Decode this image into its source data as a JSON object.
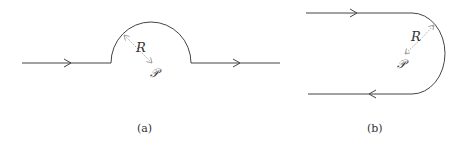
{
  "figure": {
    "panels": [
      {
        "id": "a",
        "caption": "(a)",
        "description": "Horizontal contour along real axis with semicircular indentation of radius R around point P",
        "radius_label": "R",
        "point_label": "𝒫",
        "arrow_directions": [
          "right",
          "right"
        ]
      },
      {
        "id": "b",
        "caption": "(b)",
        "description": "Closed-ish contour: top line rightward, semicircular arc of radius R around P, bottom line leftward",
        "radius_label": "R",
        "point_label": "𝒫",
        "arrow_directions": [
          "right",
          "left"
        ]
      }
    ],
    "colors": {
      "line": "#444444",
      "dashed": "#9a9a9a",
      "text": "#333333"
    }
  }
}
